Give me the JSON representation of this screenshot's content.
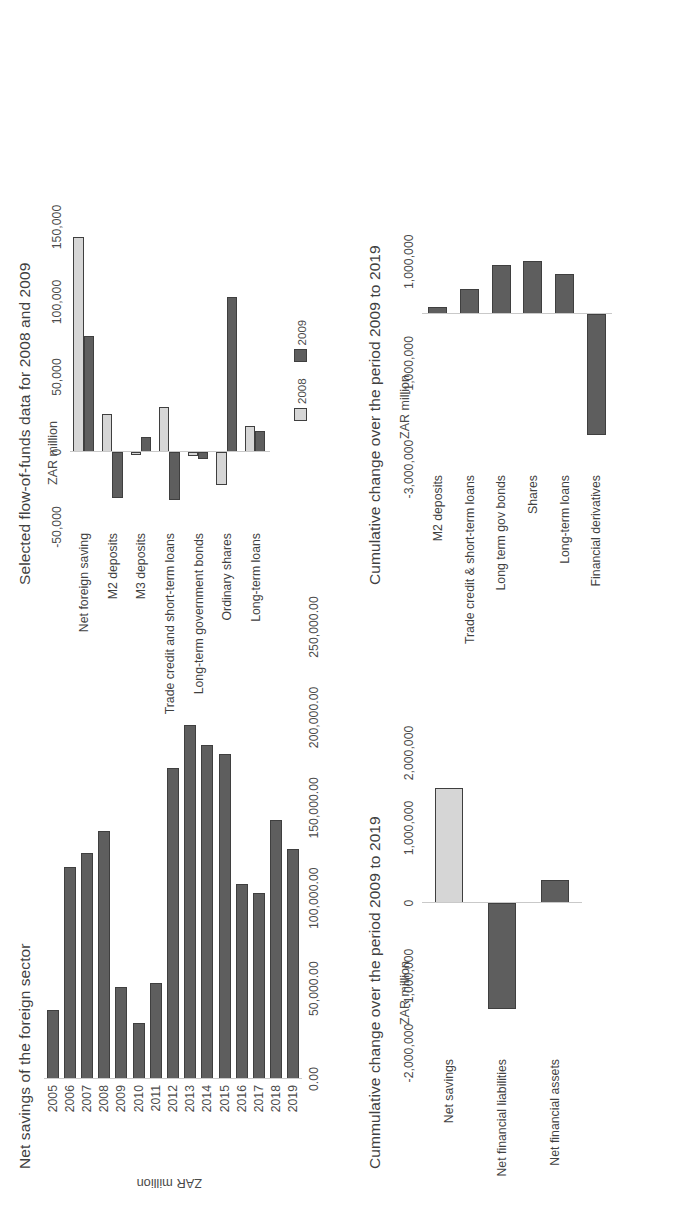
{
  "colors": {
    "series_2008": "#d6d6d6",
    "series_2009": "#5e5e5e",
    "bar_dark": "#5e5e5e",
    "bar_light": "#d6d6d6",
    "bar_edge": "#3f3f3f",
    "axis": "#c9c9c9",
    "text": "#3f3f3f",
    "page_bg": "#ffffff"
  },
  "charts": [
    {
      "id": "net-savings-foreign-sector",
      "title": "Net savings of the foreign sector",
      "ylabel": "ZAR million"
    },
    {
      "id": "selected-flow-of-funds-2008-2009",
      "title": "Selected flow-of-funds data for 2008 and 2009",
      "unit": "ZAR million"
    },
    {
      "id": "cummulative-change-2009-2019-balances",
      "title": "Cummulative change over the period 2009 to 2019",
      "unit": "ZAR million"
    },
    {
      "id": "cumulative-change-2009-2019-instruments",
      "title": "Cumulative change over the period 2009 to 2019",
      "unit": "ZAR million"
    }
  ],
  "chart_data": [
    {
      "type": "bar",
      "orientation": "horizontal",
      "title": "Net savings of the foreign sector",
      "xlabel": "",
      "ylabel": "ZAR million",
      "categories": [
        "2005",
        "2006",
        "2007",
        "2008",
        "2009",
        "2010",
        "2011",
        "2012",
        "2013",
        "2014",
        "2015",
        "2016",
        "2017",
        "2018",
        "2019"
      ],
      "values": [
        38000,
        117000,
        125000,
        137000,
        51000,
        31000,
        53000,
        172000,
        196000,
        185000,
        180000,
        108000,
        103000,
        143000,
        127000
      ],
      "ticks": [
        "0.00",
        "50,000.00",
        "100,000.00",
        "150,000.00",
        "200,000.00",
        "250,000.00"
      ],
      "tick_values": [
        0,
        50000,
        100000,
        150000,
        200000,
        250000
      ],
      "xlim": [
        0,
        250000
      ],
      "grid": false,
      "legend": "none",
      "color": "#5e5e5e"
    },
    {
      "type": "bar",
      "orientation": "horizontal",
      "title": "Selected flow-of-funds data for 2008 and 2009",
      "xlabel": "",
      "ylabel": "ZAR million",
      "categories": [
        "Net foreign saving",
        "M2 deposits",
        "M3 deposits",
        "Trade credit and short-term loans",
        "Long-term government bonds",
        "Ordinary shares",
        "Long-term loans"
      ],
      "series": [
        {
          "name": "2008",
          "color": "#d6d6d6",
          "values": [
            143000,
            25000,
            -2000,
            30000,
            -3000,
            -22000,
            17000
          ]
        },
        {
          "name": "2009",
          "color": "#5e5e5e",
          "values": [
            77000,
            -31000,
            10000,
            -32000,
            -5000,
            103000,
            14000
          ]
        }
      ],
      "ticks": [
        "-50,000",
        "0",
        "50,000",
        "100,000",
        "150,000"
      ],
      "tick_values": [
        -50000,
        0,
        50000,
        100000,
        150000
      ],
      "xlim": [
        -50000,
        150000
      ],
      "grid": false,
      "legend": "bottom",
      "legend_entries": [
        "2008",
        "2009"
      ]
    },
    {
      "type": "bar",
      "orientation": "horizontal",
      "title": "Cummulative change over the period 2009 to 2019",
      "xlabel": "",
      "ylabel": "ZAR million",
      "categories": [
        "Net savings",
        "Net financial liabilities",
        "Net financial assets"
      ],
      "values": [
        1530000,
        -1410000,
        300000
      ],
      "bar_colors": [
        "#d6d6d6",
        "#5e5e5e",
        "#5e5e5e"
      ],
      "ticks": [
        "-2,000,000",
        "-1,000,000",
        "0",
        "1,000,000",
        "2,000,000"
      ],
      "tick_values": [
        -2000000,
        -1000000,
        0,
        1000000,
        2000000
      ],
      "xlim": [
        -2000000,
        2000000
      ],
      "grid": false,
      "legend": "none"
    },
    {
      "type": "bar",
      "orientation": "horizontal",
      "title": "Cumulative change over the period 2009 to 2019",
      "xlabel": "",
      "ylabel": "ZAR million",
      "categories": [
        "M2 deposits",
        "Trade credit & short-term loans",
        "Long term gov bonds",
        "Shares",
        "Long-term loans",
        "Financial derivatives"
      ],
      "values": [
        120000,
        470000,
        930000,
        1020000,
        760000,
        -2340000
      ],
      "ticks": [
        "-3,000,000",
        "-1,000,000",
        "1,000,000"
      ],
      "tick_values": [
        -3000000,
        -1000000,
        1000000
      ],
      "xlim": [
        -3000000,
        1400000
      ],
      "grid": false,
      "legend": "none",
      "color": "#5e5e5e"
    }
  ]
}
